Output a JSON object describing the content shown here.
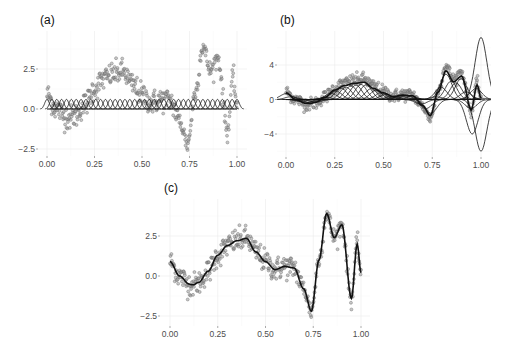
{
  "figure": {
    "panels": [
      {
        "id": "a",
        "label": "(a)"
      },
      {
        "id": "b",
        "label": "(b)"
      },
      {
        "id": "c",
        "label": "(c)"
      }
    ]
  },
  "chart_data": [
    {
      "panel": "(a)",
      "type": "scatter",
      "title": "(a)",
      "description": "Noisy observations with evenly spaced unscaled Gaussian basis functions (height ~0.6) along x-axis",
      "xlabel": "",
      "ylabel": "",
      "xlim": [
        -0.02,
        1.02
      ],
      "ylim": [
        -2.9,
        4.8
      ],
      "xticks": [
        0.0,
        0.25,
        0.5,
        0.75,
        1.0
      ],
      "xtick_labels": [
        "0.00",
        "0.25",
        "0.50",
        "0.75",
        "1.00"
      ],
      "yticks": [
        -2.5,
        0.0,
        2.5
      ],
      "ytick_labels": [
        "-2.5",
        "0.0",
        "2.5"
      ],
      "grid": true,
      "basis": {
        "n": 40,
        "height": 0.6,
        "width": 0.012
      }
    },
    {
      "panel": "(b)",
      "type": "scatter",
      "title": "(b)",
      "description": "Observations with scaled basis functions (weighted Gaussian bumps) and their sum",
      "xlabel": "",
      "ylabel": "",
      "xlim": [
        -0.02,
        1.02
      ],
      "ylim": [
        -6.5,
        7.8
      ],
      "xticks": [
        0.0,
        0.25,
        0.5,
        0.75,
        1.0
      ],
      "xtick_labels": [
        "0.00",
        "0.25",
        "0.50",
        "0.75",
        "1.00"
      ],
      "yticks": [
        -4,
        0,
        4
      ],
      "ytick_labels": [
        "-4",
        "0",
        "4"
      ],
      "grid": true,
      "bump_weights": [
        {
          "x": 0.3,
          "w": 1.0
        },
        {
          "x": 0.35,
          "w": 1.4
        },
        {
          "x": 0.4,
          "w": 1.5
        },
        {
          "x": 0.45,
          "w": 1.3
        },
        {
          "x": 0.75,
          "w": -2.0
        },
        {
          "x": 0.79,
          "w": 1.8
        },
        {
          "x": 0.83,
          "w": 3.2
        },
        {
          "x": 0.91,
          "w": 3.4
        },
        {
          "x": 0.95,
          "w": -4.0
        },
        {
          "x": 1.0,
          "w": 7.2
        },
        {
          "x": 1.0,
          "w": -6.0
        }
      ]
    },
    {
      "panel": "(c)",
      "type": "scatter",
      "title": "(c)",
      "description": "Observations with fitted smooth curve",
      "xlabel": "",
      "ylabel": "",
      "xlim": [
        -0.02,
        1.02
      ],
      "ylim": [
        -2.9,
        4.8
      ],
      "xticks": [
        0.0,
        0.25,
        0.5,
        0.75,
        1.0
      ],
      "xtick_labels": [
        "0.00",
        "0.25",
        "0.50",
        "0.75",
        "1.00"
      ],
      "yticks": [
        -2.5,
        0.0,
        2.5
      ],
      "ytick_labels": [
        "-2.5",
        "0.0",
        "2.5"
      ],
      "grid": true,
      "fitted_curve": {
        "x": [
          0.0,
          0.05,
          0.1,
          0.12,
          0.15,
          0.2,
          0.25,
          0.3,
          0.35,
          0.4,
          0.45,
          0.5,
          0.55,
          0.6,
          0.65,
          0.7,
          0.74,
          0.78,
          0.82,
          0.86,
          0.9,
          0.95,
          0.98,
          1.0
        ],
        "y": [
          0.9,
          0.0,
          -0.5,
          -0.55,
          -0.4,
          0.3,
          1.3,
          1.9,
          2.2,
          2.35,
          1.5,
          0.9,
          0.4,
          0.6,
          0.5,
          -0.8,
          -2.2,
          1.0,
          3.9,
          2.4,
          3.2,
          -1.4,
          2.0,
          0.2
        ]
      }
    }
  ]
}
